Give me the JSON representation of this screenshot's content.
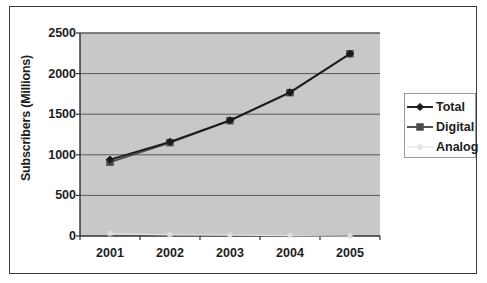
{
  "chart_data": {
    "type": "line",
    "title": "",
    "subtitle": "",
    "xlabel": "",
    "ylabel": "Subscribers (Millions)",
    "categories": [
      "2001",
      "2002",
      "2003",
      "2004",
      "2005"
    ],
    "x": [
      2001,
      2002,
      2003,
      2004,
      2005
    ],
    "xtick_labels": [
      "2001",
      "2002",
      "2003",
      "2004",
      "2005"
    ],
    "ytick_labels": [
      "0",
      "500",
      "1000",
      "1500",
      "2000",
      "2500"
    ],
    "yticks": [
      0,
      500,
      1000,
      1500,
      2000,
      2500
    ],
    "ylim": [
      0,
      2500
    ],
    "grid": "horizontal",
    "legend_position": "right",
    "plot_background": "#c8c8c8",
    "series": [
      {
        "name": "Total",
        "marker": "diamond",
        "color": "#1a1a1a",
        "values": [
          940,
          1160,
          1425,
          1770,
          2245
        ]
      },
      {
        "name": "Digital",
        "marker": "square",
        "color": "#4a4a4a",
        "values": [
          910,
          1150,
          1420,
          1765,
          2245
        ]
      },
      {
        "name": "Analog",
        "marker": "star",
        "color": "#e2e2e2",
        "values": [
          30,
          15,
          10,
          5,
          0
        ]
      }
    ]
  },
  "legend": {
    "items": [
      {
        "label": "Total"
      },
      {
        "label": "Digital"
      },
      {
        "label": "Analog"
      }
    ]
  },
  "axes": {
    "y_title": "Subscribers (Millions)"
  }
}
